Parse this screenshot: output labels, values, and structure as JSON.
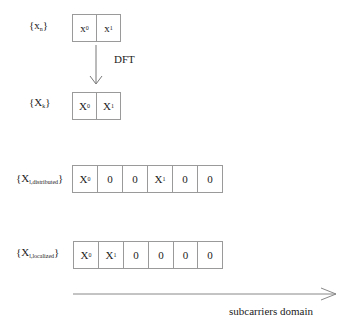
{
  "time_domain": {
    "label": {
      "base": "{x",
      "sub": "n",
      "close": "}"
    },
    "cells": [
      {
        "base": "x",
        "sub": "0"
      },
      {
        "base": "x",
        "sub": "1"
      }
    ]
  },
  "transform": {
    "label": "DFT"
  },
  "freq_domain": {
    "label": {
      "base": "{X",
      "sub": "k",
      "close": "}"
    },
    "cells": [
      {
        "base": "X",
        "sub": "0"
      },
      {
        "base": "X",
        "sub": "1"
      }
    ]
  },
  "distributed": {
    "label": {
      "base": "{X",
      "sub": "l,distributed",
      "close": "}"
    },
    "cells": [
      {
        "base": "X",
        "sub": "0"
      },
      {
        "base": "0",
        "sub": ""
      },
      {
        "base": "0",
        "sub": ""
      },
      {
        "base": "X",
        "sub": "1"
      },
      {
        "base": "0",
        "sub": ""
      },
      {
        "base": "0",
        "sub": ""
      }
    ]
  },
  "localized": {
    "label": {
      "base": "{X",
      "sub": "l,localized",
      "close": "}"
    },
    "cells": [
      {
        "base": "X",
        "sub": "0"
      },
      {
        "base": "X",
        "sub": "1"
      },
      {
        "base": "0",
        "sub": ""
      },
      {
        "base": "0",
        "sub": ""
      },
      {
        "base": "0",
        "sub": ""
      },
      {
        "base": "0",
        "sub": ""
      }
    ]
  },
  "axis": {
    "label": "subcarriers domain"
  }
}
